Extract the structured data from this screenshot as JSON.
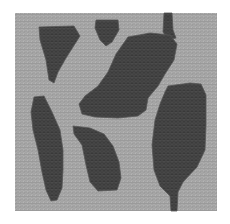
{
  "figure": {
    "type": "mesh-domain",
    "frame": {
      "x": 15,
      "y": 13,
      "width": 202,
      "height": 198
    },
    "colors": {
      "page": "#ffffff",
      "background_region": "#9a9a9a",
      "inclusion_region": "#4b4b4b",
      "mesh_light": "#c4c4c4",
      "mesh_dark": "#2f2f2f"
    },
    "regions": [
      {
        "name": "inclusion-top-left",
        "points": [
          [
            39,
            27
          ],
          [
            74,
            26
          ],
          [
            80,
            36
          ],
          [
            66,
            58
          ],
          [
            58,
            72
          ],
          [
            54,
            83
          ],
          [
            49,
            80
          ],
          [
            46,
            60
          ],
          [
            40,
            40
          ]
        ]
      },
      {
        "name": "inclusion-top-small",
        "points": [
          [
            96,
            20
          ],
          [
            118,
            20
          ],
          [
            119,
            30
          ],
          [
            112,
            42
          ],
          [
            106,
            46
          ],
          [
            100,
            40
          ],
          [
            95,
            28
          ]
        ]
      },
      {
        "name": "inclusion-top-stripe",
        "points": [
          [
            164,
            13
          ],
          [
            172,
            13
          ],
          [
            173,
            30
          ],
          [
            176,
            38
          ],
          [
            168,
            40
          ],
          [
            163,
            32
          ]
        ]
      },
      {
        "name": "inclusion-center-large",
        "points": [
          [
            128,
            37
          ],
          [
            150,
            33
          ],
          [
            170,
            35
          ],
          [
            177,
            44
          ],
          [
            174,
            60
          ],
          [
            165,
            74
          ],
          [
            158,
            86
          ],
          [
            148,
            98
          ],
          [
            146,
            110
          ],
          [
            138,
            116
          ],
          [
            118,
            118
          ],
          [
            95,
            117
          ],
          [
            82,
            114
          ],
          [
            79,
            104
          ],
          [
            85,
            96
          ],
          [
            98,
            86
          ],
          [
            108,
            72
          ],
          [
            116,
            54
          ]
        ]
      },
      {
        "name": "inclusion-left-vertical",
        "points": [
          [
            34,
            97
          ],
          [
            44,
            96
          ],
          [
            52,
            112
          ],
          [
            60,
            130
          ],
          [
            63,
            150
          ],
          [
            63,
            170
          ],
          [
            62,
            188
          ],
          [
            57,
            200
          ],
          [
            51,
            201
          ],
          [
            46,
            190
          ],
          [
            42,
            172
          ],
          [
            38,
            150
          ],
          [
            33,
            130
          ],
          [
            31,
            112
          ]
        ]
      },
      {
        "name": "inclusion-bottom-middle",
        "points": [
          [
            73,
            126
          ],
          [
            90,
            128
          ],
          [
            104,
            134
          ],
          [
            113,
            146
          ],
          [
            119,
            162
          ],
          [
            121,
            178
          ],
          [
            117,
            190
          ],
          [
            98,
            191
          ],
          [
            90,
            182
          ],
          [
            86,
            165
          ],
          [
            82,
            145
          ],
          [
            74,
            134
          ]
        ]
      },
      {
        "name": "inclusion-right-vertical",
        "points": [
          [
            168,
            86
          ],
          [
            190,
            83
          ],
          [
            201,
            84
          ],
          [
            206,
            95
          ],
          [
            206,
            125
          ],
          [
            205,
            150
          ],
          [
            197,
            167
          ],
          [
            183,
            182
          ],
          [
            178,
            192
          ],
          [
            177,
            211
          ],
          [
            171,
            211
          ],
          [
            170,
            196
          ],
          [
            160,
            186
          ],
          [
            154,
            170
          ],
          [
            152,
            145
          ],
          [
            155,
            120
          ],
          [
            160,
            104
          ],
          [
            165,
            92
          ]
        ]
      }
    ]
  }
}
